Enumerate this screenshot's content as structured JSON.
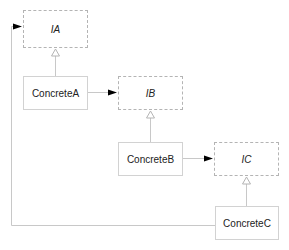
{
  "diagram": {
    "type": "uml-class",
    "colors": {
      "line": "#c8c8c8",
      "arrow_fill": "#000000",
      "text": "#222222"
    },
    "nodes": [
      {
        "id": "IA",
        "label": "IA",
        "kind": "interface",
        "x": 23,
        "y": 10,
        "w": 65,
        "h": 38
      },
      {
        "id": "ConcreteA",
        "label": "ConcreteA",
        "kind": "class",
        "x": 23,
        "y": 76,
        "w": 65,
        "h": 34
      },
      {
        "id": "IB",
        "label": "IB",
        "kind": "interface",
        "x": 118,
        "y": 76,
        "w": 65,
        "h": 34
      },
      {
        "id": "ConcreteB",
        "label": "ConcreteB",
        "kind": "class",
        "x": 118,
        "y": 142,
        "w": 65,
        "h": 34
      },
      {
        "id": "IC",
        "label": "IC",
        "kind": "interface",
        "x": 214,
        "y": 142,
        "w": 65,
        "h": 34
      },
      {
        "id": "ConcreteC",
        "label": "ConcreteC",
        "kind": "class",
        "x": 215,
        "y": 206,
        "w": 64,
        "h": 34
      }
    ],
    "edges": [
      {
        "from": "ConcreteA",
        "to": "IA",
        "kind": "realization"
      },
      {
        "from": "ConcreteA",
        "to": "IB",
        "kind": "dependency"
      },
      {
        "from": "ConcreteB",
        "to": "IB",
        "kind": "realization"
      },
      {
        "from": "ConcreteB",
        "to": "IC",
        "kind": "dependency"
      },
      {
        "from": "ConcreteC",
        "to": "IC",
        "kind": "realization"
      },
      {
        "from": "ConcreteC",
        "to": "IA",
        "kind": "dependency"
      }
    ]
  }
}
